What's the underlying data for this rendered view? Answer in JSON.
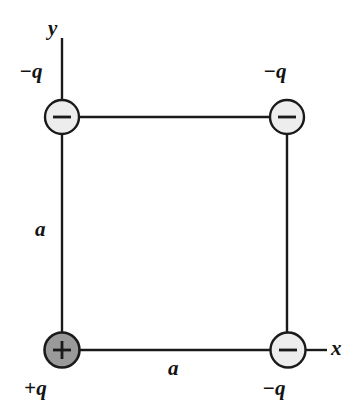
{
  "figure": {
    "type": "physics-diagram",
    "background_color": "#ffffff",
    "line_color": "#1a1a1a"
  },
  "axes": {
    "y_label": "y",
    "x_label": "x"
  },
  "dimensions": [
    {
      "label": "a",
      "side": "left"
    },
    {
      "label": "a",
      "side": "bottom"
    }
  ],
  "charges": [
    {
      "id": "top-left",
      "label": "−q",
      "sign": "−",
      "fill": "#ededed",
      "polarity": "negative"
    },
    {
      "id": "top-right",
      "label": "−q",
      "sign": "−",
      "fill": "#ededed",
      "polarity": "negative"
    },
    {
      "id": "bottom-left",
      "label": "+q",
      "sign": "+",
      "fill": "#9a9a9a",
      "polarity": "positive"
    },
    {
      "id": "bottom-right",
      "label": "−q",
      "sign": "−",
      "fill": "#ededed",
      "polarity": "negative"
    }
  ]
}
